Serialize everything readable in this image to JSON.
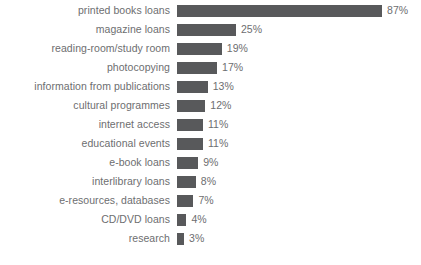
{
  "chart_data": {
    "type": "bar",
    "orientation": "horizontal",
    "title": "",
    "subtitle": "",
    "xlabel": "",
    "ylabel": "",
    "grid": false,
    "legend": false,
    "legend_position": "none",
    "axis_line": false,
    "tick_labels_x": [],
    "xlim": [
      0,
      87
    ],
    "value_suffix": "%",
    "bar_color": "#58595B",
    "label_color": "#6D6E70",
    "background_color": "#FFFFFF",
    "categories": [
      "printed books loans",
      "magazine loans",
      "reading-room/study room",
      "photocopying",
      "information from publications",
      "cultural programmes",
      "internet access",
      "educational events",
      "e-book loans",
      "interlibrary loans",
      "e-resources, databases",
      "CD/DVD loans",
      "research"
    ],
    "values": [
      87,
      25,
      19,
      17,
      13,
      12,
      11,
      11,
      9,
      8,
      7,
      4,
      3
    ],
    "value_labels": [
      "87%",
      "25%",
      "19%",
      "17%",
      "13%",
      "12%",
      "11%",
      "11%",
      "9%",
      "8%",
      "7%",
      "4%",
      "3%"
    ]
  }
}
